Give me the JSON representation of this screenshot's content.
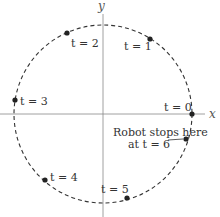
{
  "diagram": {
    "axes": {
      "x_label": "x",
      "y_label": "y"
    },
    "points": [
      {
        "label": "t = 0"
      },
      {
        "label": "t = 1"
      },
      {
        "label": "t = 2"
      },
      {
        "label": "t = 3"
      },
      {
        "label": "t = 4"
      },
      {
        "label": "t = 5"
      }
    ],
    "annotation": {
      "line1": "Robot stops here",
      "line2": "at t = 6"
    }
  }
}
